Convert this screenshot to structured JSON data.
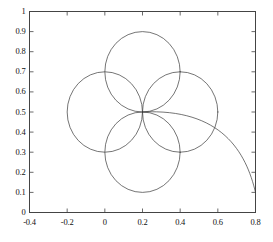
{
  "chart_data": {
    "type": "line",
    "title": "",
    "xlabel": "",
    "ylabel": "",
    "xlim": [
      -0.4,
      0.8
    ],
    "ylim": [
      0.0,
      1.0
    ],
    "grid": false,
    "legend": false,
    "xticks": [
      -0.4,
      -0.2,
      0,
      0.2,
      0.4,
      0.6,
      0.8
    ],
    "xticklabels": [
      "-0.4",
      "-0.2",
      "0",
      "0.2",
      "0.4",
      "0.6",
      "0.8"
    ],
    "yticks": [
      0,
      0.1,
      0.2,
      0.3,
      0.4,
      0.5,
      0.6,
      0.7,
      0.8,
      0.9,
      1
    ],
    "yticklabels": [
      "0",
      "0.1",
      "0.2",
      "0.3",
      "0.4",
      "0.5",
      "0.6",
      "0.7",
      "0.8",
      "0.9",
      "1"
    ],
    "line_color": "#3a3a3a",
    "line_width": 0.7,
    "common_point": [
      0.2,
      0.5
    ],
    "series": [
      {
        "name": "loop-upper-left",
        "shape": "circle",
        "center": [
          0.0,
          0.5
        ],
        "radius": 0.2,
        "extent_x": [
          -0.2,
          0.2
        ],
        "extent_y": [
          0.3,
          0.7
        ]
      },
      {
        "name": "loop-upper",
        "shape": "circle",
        "center": [
          0.2,
          0.7
        ],
        "radius": 0.2,
        "extent_x": [
          0.0,
          0.4
        ],
        "extent_y": [
          0.5,
          0.9
        ]
      },
      {
        "name": "loop-right",
        "shape": "circle",
        "center": [
          0.4,
          0.5
        ],
        "radius": 0.2,
        "extent_x": [
          0.2,
          0.6
        ],
        "extent_y": [
          0.3,
          0.7
        ]
      },
      {
        "name": "loop-lower",
        "shape": "circle",
        "center": [
          0.2,
          0.3
        ],
        "radius": 0.2,
        "extent_x": [
          0.0,
          0.4
        ],
        "extent_y": [
          0.1,
          0.5
        ]
      },
      {
        "name": "escape-tail",
        "shape": "open-curve",
        "start": [
          0.2,
          0.5
        ],
        "end": [
          0.8,
          0.1
        ],
        "control": [
          0.62,
          0.52
        ],
        "control2": [
          0.75,
          0.3
        ]
      }
    ]
  }
}
